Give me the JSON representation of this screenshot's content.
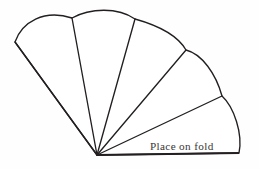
{
  "figure": {
    "kind": "sewing-pattern-outline",
    "background_color": "#fefefe",
    "line_color": "#231f20",
    "fill_color": "#ffffff",
    "canvas": {
      "width": 259,
      "height": 169
    }
  },
  "labels": {
    "fold_text": "Place on fold",
    "fold_text_color": "#3a3436",
    "fold_text_x": 150,
    "fold_text_y": 150
  },
  "geometry": {
    "apex": {
      "x": 97,
      "y": 155
    },
    "left_tip": {
      "x": 15,
      "y": 42
    },
    "right_tip": {
      "x": 239,
      "y": 153
    },
    "segment_count": 5,
    "arc_junctions": [
      {
        "x": 72,
        "y": 18
      },
      {
        "x": 135,
        "y": 19
      },
      {
        "x": 186,
        "y": 50
      },
      {
        "x": 222,
        "y": 96
      }
    ],
    "outer_boundary_path": "M 15 42 C 22 22 44 9 72 18 C 90 8 118 7 135 19 C 160 26 178 36 186 50 C 202 54 216 74 222 96 C 234 107 243 134 239 153 L 97 155 Z",
    "rib_paths": [
      "M 97 155 L 15 42",
      "M 97 155 L 72 18",
      "M 97 155 L 135 19",
      "M 97 155 L 186 50",
      "M 97 155 L 222 96"
    ],
    "fold_edge_path": "M 97 155 L 239 153"
  }
}
